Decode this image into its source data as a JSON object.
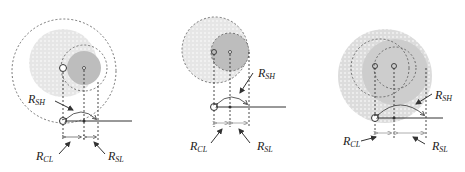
{
  "figure": {
    "colors": {
      "large_circle_fill": "#e8e8e8",
      "small_circle_fill": "#bdbdbd",
      "line": "#333333",
      "dashed": "#555555",
      "arrow_light": "#999999"
    },
    "panels": [
      {
        "id": "left",
        "labels": {
          "sh": "R",
          "sh_sub": "SH",
          "cl": "R",
          "cl_sub": "CL",
          "sl": "R",
          "sl_sub": "SL"
        }
      },
      {
        "id": "middle",
        "labels": {
          "sh": "R",
          "sh_sub": "SH",
          "cl": "R",
          "cl_sub": "CL",
          "sl": "R",
          "sl_sub": "SL"
        }
      },
      {
        "id": "right",
        "labels": {
          "sh": "R",
          "sh_sub": "SH",
          "cl": "R",
          "cl_sub": "CL",
          "sl": "R",
          "sl_sub": "SL"
        }
      }
    ]
  }
}
